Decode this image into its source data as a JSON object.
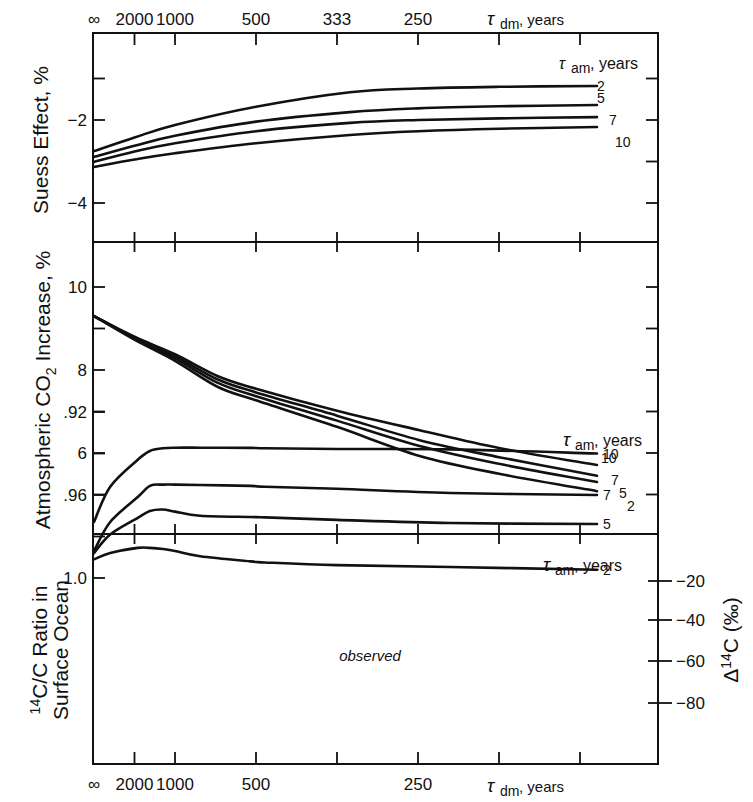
{
  "figure": {
    "x_axis": {
      "label_symbol": "τ",
      "label_sub": "dm",
      "label_unit": ", years",
      "scale": "reciprocal (1000/τ_dm, 1/kyr)",
      "ticks": [
        {
          "label": "∞",
          "inv": 0
        },
        {
          "label": "2000",
          "inv": 0.5
        },
        {
          "label": "1000",
          "inv": 1.0
        },
        {
          "label": "500",
          "inv": 2.0
        },
        {
          "label": "333",
          "inv": 3.0
        },
        {
          "label": "250",
          "inv": 4.0
        },
        {
          "label": "",
          "inv": 5.0
        },
        {
          "label": "",
          "inv": 6.0
        }
      ],
      "bottom_ticks_labels": [
        "∞",
        "2000",
        "1000",
        "500",
        "",
        "250",
        "",
        ""
      ],
      "range_inv": [
        0,
        7
      ]
    },
    "legend_title": {
      "symbol": "τ",
      "sub": "am",
      "unit": ", years"
    }
  },
  "chart_data": [
    {
      "type": "line",
      "title": "",
      "xlabel": "τdm, years",
      "ylabel": "Suess Effect, %",
      "ylim": [
        -5,
        0
      ],
      "yticks": [
        {
          "v": -1,
          "label": ""
        },
        {
          "v": -2,
          "label": "−2"
        },
        {
          "v": -4,
          "label": "−4"
        }
      ],
      "right_ticks": [
        -1,
        -2,
        -3,
        -4
      ],
      "grid": false,
      "legend": "τam, years (labels at line ends)",
      "x_inv": [
        0,
        0.5,
        1.0,
        2.0,
        3.16,
        4.0,
        5.0,
        6.21
      ],
      "series": [
        {
          "name": "2",
          "values": [
            -2.75,
            -2.42,
            -2.12,
            -1.68,
            -1.33,
            -1.24,
            -1.2,
            -1.18
          ]
        },
        {
          "name": "5",
          "values": [
            -2.89,
            -2.62,
            -2.38,
            -2.04,
            -1.81,
            -1.72,
            -1.67,
            -1.64
          ]
        },
        {
          "name": "7",
          "values": [
            -3.01,
            -2.76,
            -2.56,
            -2.27,
            -2.07,
            -2.0,
            -1.96,
            -1.93
          ]
        },
        {
          "name": "10",
          "values": [
            -3.13,
            -2.95,
            -2.8,
            -2.56,
            -2.36,
            -2.27,
            -2.21,
            -2.17
          ]
        }
      ],
      "series_label_style": "stacked"
    },
    {
      "type": "line",
      "title": "",
      "xlabel": "τdm, years",
      "ylabel": "Atmospheric CO2 Increase, %",
      "ylim": [
        4.0,
        11.0
      ],
      "yticks": [
        {
          "v": 10,
          "label": "10"
        },
        {
          "v": 9,
          "label": ""
        },
        {
          "v": 8,
          "label": "8"
        },
        {
          "v": 7,
          "label": ""
        },
        {
          "v": 6,
          "label": "6"
        },
        {
          "v": 5,
          "label": ""
        }
      ],
      "right_ticks": [
        10,
        9,
        8,
        7,
        6,
        5
      ],
      "grid": false,
      "legend": "τam, years (labels at line ends)",
      "x_inv": [
        0,
        0.5,
        1.0,
        1.53,
        2.0,
        3.0,
        4.02,
        5.0,
        6.21
      ],
      "series": [
        {
          "name": "10",
          "values": [
            9.3,
            8.8,
            8.38,
            7.85,
            7.55,
            7.02,
            6.55,
            6.12,
            5.71
          ]
        },
        {
          "name": "7",
          "values": [
            9.3,
            8.78,
            8.33,
            7.77,
            7.46,
            6.9,
            6.31,
            5.9,
            5.45
          ]
        },
        {
          "name": "5",
          "values": [
            9.3,
            8.76,
            8.28,
            7.69,
            7.37,
            6.78,
            6.17,
            5.74,
            5.3
          ]
        },
        {
          "name": "2",
          "values": [
            9.3,
            8.73,
            8.22,
            7.59,
            7.27,
            6.63,
            5.93,
            5.5,
            5.08
          ]
        }
      ]
    },
    {
      "type": "line",
      "title": "",
      "xlabel": "τdm, years",
      "ylabel": "14C/C Ratio in Surface Ocean",
      "ylabel_line1": "C/C Ratio in",
      "ylabel_line1_sup": "14",
      "ylabel_line2": "Surface Ocean",
      "y2label": "Δ14C (‰)",
      "ylim": [
        0.91,
        1.021
      ],
      "yticks": [
        {
          "v": 1.0,
          "label": "1.0"
        },
        {
          "v": 0.98,
          "label": ""
        },
        {
          "v": 0.96,
          "label": ".96"
        },
        {
          "v": 0.94,
          "label": ""
        },
        {
          "v": 0.92,
          "label": ".92"
        }
      ],
      "y2ticks": [
        {
          "v": -20,
          "label": "−20",
          "y": 581
        },
        {
          "v": -40,
          "label": "−40",
          "y": 620
        },
        {
          "v": -60,
          "label": "−60",
          "y": 661
        },
        {
          "v": -80,
          "label": "−80",
          "y": 703
        }
      ],
      "grid": false,
      "legend": "τam, years (labels at line ends)",
      "x_inv": [
        0,
        0.2,
        0.54,
        0.69,
        0.85,
        1.0,
        1.31,
        1.93,
        2.11,
        3.0,
        4.4,
        6.21
      ],
      "series": [
        {
          "name": "2",
          "values": [
            0.991,
            0.988,
            0.9855,
            0.9855,
            0.986,
            0.987,
            0.9895,
            0.992,
            0.9925,
            0.9938,
            0.9947,
            0.996
          ]
        },
        {
          "name": "5",
          "values": [
            0.988,
            0.979,
            0.971,
            0.9677,
            0.967,
            0.968,
            0.97,
            0.9706,
            0.9708,
            0.972,
            0.9735,
            0.974
          ]
        },
        {
          "name": "7",
          "values": [
            0.987,
            0.973,
            0.961,
            0.9556,
            0.955,
            0.955,
            0.9552,
            0.9556,
            0.956,
            0.957,
            0.959,
            0.96
          ]
        },
        {
          "name": "10",
          "values": [
            0.973,
            0.956,
            0.943,
            0.9388,
            0.9375,
            0.9372,
            0.9372,
            0.9373,
            0.9375,
            0.9378,
            0.938,
            0.94
          ]
        }
      ],
      "annotations": [
        {
          "type": "band",
          "label": "observed",
          "y_top": 0.9675,
          "y_bottom": 0.959,
          "x_inv": [
            0,
            6.21
          ]
        }
      ]
    }
  ]
}
